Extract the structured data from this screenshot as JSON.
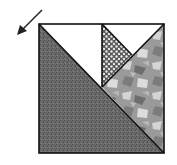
{
  "diagram": {
    "type": "quilt-block",
    "colors": {
      "background": "#ffffff",
      "outline": "#111111",
      "dark_fabric": "#6b6b6b",
      "dark_fabric_speckle": "#4a4a4a",
      "white_fabric": "#ffffff",
      "dotted_fabric_base": "#5a5a5a",
      "dotted_fabric_dots": "#e8e8e8",
      "print_fabric_base": "#9a9a9a",
      "print_fabric_light": "#d4d4d4",
      "print_fabric_dark": "#6e6e6e"
    },
    "pieces": [
      {
        "name": "large-dark-triangle",
        "fabric": "dark mottled",
        "points": "39,24 164,153 39,153"
      },
      {
        "name": "top-left-white-triangle",
        "fabric": "white",
        "points": "39,24 102,24 102,87"
      },
      {
        "name": "dotted-triangle",
        "fabric": "dotted",
        "points": "102,24 132,55 102,87"
      },
      {
        "name": "top-right-white-triangle",
        "fabric": "white",
        "points": "102,24 164,24 132,55"
      },
      {
        "name": "print-triangle",
        "fabric": "abstract print",
        "points": "164,24 164,153 102,87"
      }
    ],
    "arrow": {
      "from": [
        42,
        10
      ],
      "to": [
        18,
        34
      ],
      "direction": "down-left"
    }
  }
}
